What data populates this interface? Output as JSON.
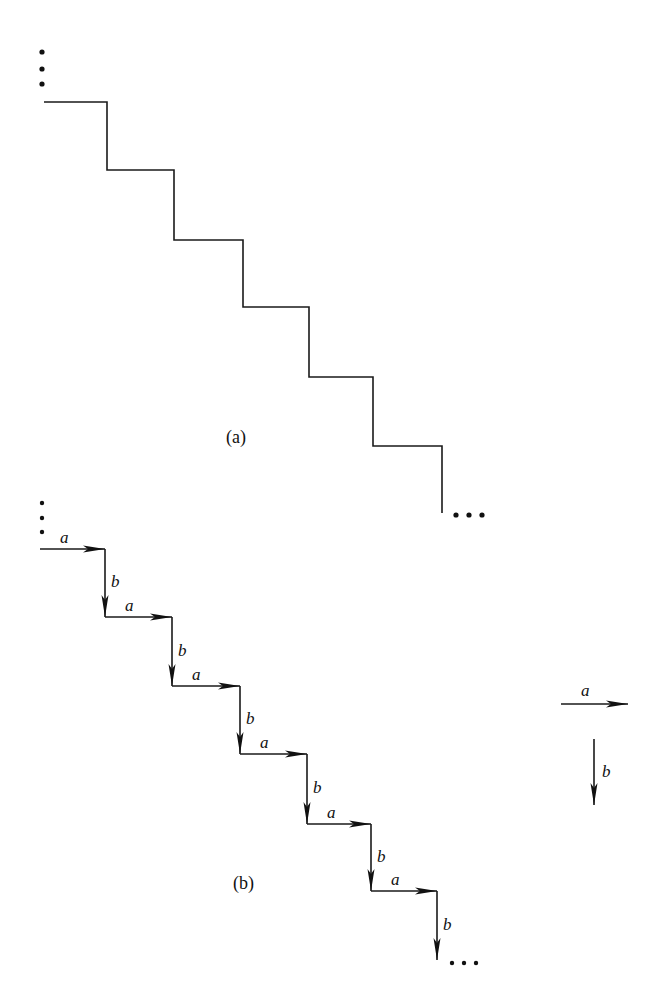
{
  "diagram": {
    "panel_a": {
      "caption": "(a)",
      "caption_pos": [
        226,
        443
      ],
      "points": [
        [
          44,
          102
        ],
        [
          107,
          102
        ],
        [
          107,
          170
        ],
        [
          174,
          170
        ],
        [
          174,
          240
        ],
        [
          243,
          240
        ],
        [
          243,
          307
        ],
        [
          309,
          307
        ],
        [
          309,
          377
        ],
        [
          373,
          377
        ],
        [
          373,
          446
        ],
        [
          442,
          446
        ],
        [
          442,
          513
        ]
      ],
      "ellipsis_start": [
        [
          42,
          52
        ],
        [
          42,
          69
        ],
        [
          42,
          84
        ]
      ],
      "ellipsis_end": [
        [
          456,
          515
        ],
        [
          469,
          515
        ],
        [
          482,
          515
        ]
      ]
    },
    "panel_b": {
      "caption": "(b)",
      "caption_pos": [
        233,
        889
      ],
      "points": [
        [
          40,
          549
        ],
        [
          105,
          549
        ],
        [
          105,
          617
        ],
        [
          172,
          617
        ],
        [
          172,
          686
        ],
        [
          240,
          686
        ],
        [
          240,
          754
        ],
        [
          307,
          754
        ],
        [
          307,
          824
        ],
        [
          371,
          824
        ],
        [
          371,
          891
        ],
        [
          437,
          891
        ],
        [
          437,
          960
        ]
      ],
      "horizontal_label": "a",
      "vertical_label": "b",
      "ellipsis_start": [
        [
          42,
          503
        ],
        [
          42,
          518
        ],
        [
          42,
          532
        ]
      ],
      "ellipsis_end": [
        [
          452,
          963
        ],
        [
          464,
          963
        ],
        [
          476,
          963
        ]
      ]
    },
    "legend": {
      "a": {
        "label": "a",
        "from": [
          561,
          704
        ],
        "to": [
          628,
          704
        ],
        "label_pos": [
          581,
          696
        ]
      },
      "b": {
        "label": "b",
        "from": [
          594,
          739
        ],
        "to": [
          594,
          805
        ],
        "label_pos": [
          602,
          777
        ]
      }
    }
  }
}
